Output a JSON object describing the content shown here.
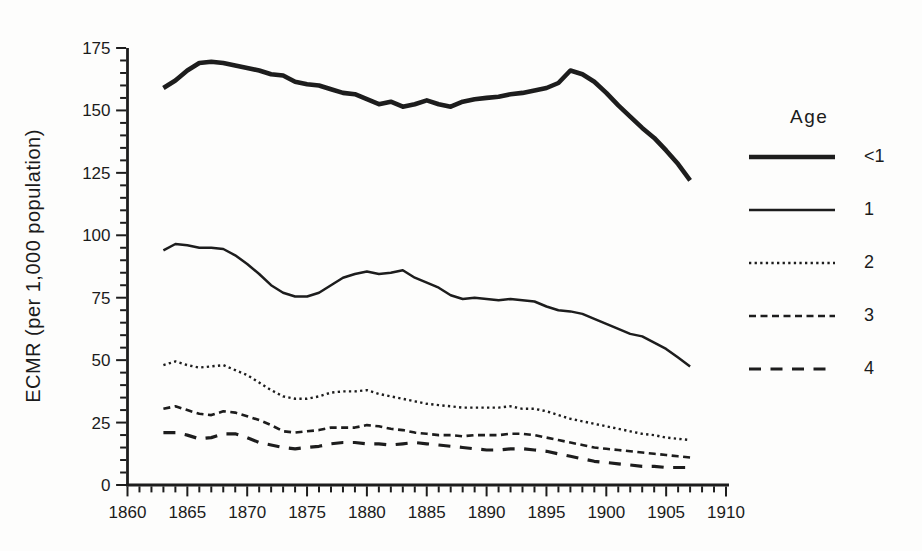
{
  "chart_data": {
    "type": "line",
    "title": "",
    "xlabel": "",
    "ylabel": "ECMR (per 1,000 population)",
    "x_range": [
      1860,
      1910
    ],
    "y_range": [
      0,
      175
    ],
    "x_major_ticks": [
      1860,
      1865,
      1870,
      1875,
      1880,
      1885,
      1890,
      1895,
      1900,
      1905,
      1910
    ],
    "x_minor_step": 1,
    "y_major_ticks": [
      0,
      25,
      50,
      75,
      100,
      125,
      150,
      175
    ],
    "y_minor_step": 5,
    "grid": "off",
    "legend_position": "right",
    "legend_title": "Age",
    "line_color": "#1d1d1d",
    "years": [
      1863,
      1864,
      1865,
      1866,
      1867,
      1868,
      1869,
      1870,
      1871,
      1872,
      1873,
      1874,
      1875,
      1876,
      1877,
      1878,
      1879,
      1880,
      1881,
      1882,
      1883,
      1884,
      1885,
      1886,
      1887,
      1888,
      1889,
      1890,
      1891,
      1892,
      1893,
      1894,
      1895,
      1896,
      1897,
      1898,
      1899,
      1900,
      1901,
      1902,
      1903,
      1904,
      1905,
      1906,
      1907
    ],
    "series": [
      {
        "name": "<1",
        "line_style": "solid-thick",
        "values": [
          159,
          162,
          166,
          169,
          169.5,
          169,
          168,
          167,
          166,
          164.5,
          164,
          161.5,
          160.5,
          160,
          158.5,
          157,
          156.5,
          154.5,
          152.5,
          153.5,
          151.5,
          152.5,
          154,
          152.5,
          151.5,
          153.5,
          154.5,
          155,
          155.5,
          156.5,
          157,
          158,
          159,
          161,
          166,
          164.5,
          161.5,
          157,
          152,
          147.5,
          143,
          139,
          134,
          128.5,
          122
        ]
      },
      {
        "name": "1",
        "line_style": "solid-thin",
        "values": [
          94,
          96.5,
          96,
          95,
          95,
          94.5,
          92,
          88.5,
          84.5,
          80,
          77,
          75.5,
          75.5,
          77,
          80,
          83,
          84.5,
          85.5,
          84.5,
          85,
          86,
          83,
          81,
          79,
          76,
          74.5,
          75,
          74.5,
          74,
          74.5,
          74,
          73.5,
          71.5,
          70,
          69.5,
          68.5,
          66.5,
          64.5,
          62.5,
          60.5,
          59.5,
          57,
          54.5,
          51,
          47.5
        ]
      },
      {
        "name": "2",
        "line_style": "dotted",
        "values": [
          48,
          49.5,
          48,
          47,
          47.5,
          48,
          46,
          44,
          41,
          38,
          35.5,
          34.5,
          34.5,
          35.5,
          37,
          37.5,
          37.5,
          38,
          36.5,
          35.5,
          34.5,
          33.5,
          32.5,
          32,
          31.5,
          31,
          31,
          31,
          31,
          31.5,
          30.5,
          30.5,
          29.5,
          28,
          26.5,
          25.5,
          24.5,
          23.5,
          22.5,
          21.5,
          20.5,
          20,
          19,
          18.5,
          18
        ]
      },
      {
        "name": "3",
        "line_style": "dashed-short",
        "values": [
          30.5,
          31.5,
          30,
          28.5,
          28,
          29.5,
          29,
          27.5,
          26,
          24,
          21.5,
          21,
          21.5,
          22,
          23,
          23,
          23,
          24,
          23.5,
          22.5,
          22,
          21,
          20.5,
          20,
          20,
          19.5,
          20,
          20,
          20,
          20.5,
          20.5,
          20,
          19,
          18,
          17,
          16,
          15,
          14.5,
          14,
          13.5,
          13,
          12.5,
          12,
          11.5,
          11
        ]
      },
      {
        "name": "4",
        "line_style": "dashed-long",
        "values": [
          21,
          21,
          20,
          18.5,
          19,
          20.5,
          20.5,
          19,
          17,
          16,
          15,
          14.5,
          15,
          15.5,
          16.5,
          17,
          17,
          16.5,
          16.5,
          16,
          16.5,
          17,
          16.5,
          16,
          15.5,
          15,
          14.5,
          14,
          14,
          14.5,
          14.5,
          14,
          13.5,
          12.5,
          11.5,
          10.5,
          9.5,
          9,
          8.5,
          8,
          7.5,
          7.5,
          7,
          7,
          7
        ]
      }
    ]
  }
}
